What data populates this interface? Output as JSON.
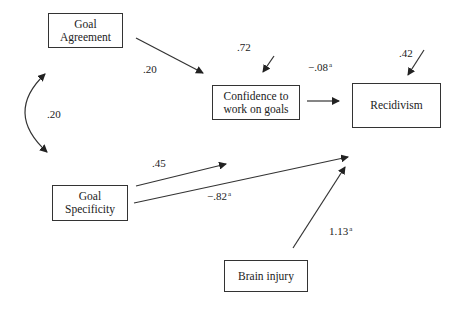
{
  "diagram": {
    "type": "path-model",
    "nodes": {
      "goal_agreement": {
        "line1": "Goal",
        "line2": "Agreement"
      },
      "confidence": {
        "line1": "Confidence to",
        "line2": "work on goals"
      },
      "recidivism": {
        "line1": "Recidivism"
      },
      "goal_specificity": {
        "line1": "Goal",
        "line2": "Specificity"
      },
      "brain_injury": {
        "line1": "Brain injury"
      }
    },
    "edges": [
      {
        "from": "Goal Agreement",
        "to": "Confidence to work on goals",
        "coef": ".20",
        "sup": ""
      },
      {
        "from": "Goal Specificity",
        "to": "Confidence to work on goals",
        "coef": ".45",
        "sup": ""
      },
      {
        "from": "Confidence to work on goals",
        "to": "Recidivism",
        "coef": "−.08",
        "sup": "a"
      },
      {
        "from": "Goal Specificity",
        "to": "Recidivism",
        "coef": "−.82",
        "sup": "a"
      },
      {
        "from": "Brain injury",
        "to": "Recidivism",
        "coef": "1.13",
        "sup": "a"
      }
    ],
    "correlation": {
      "between": [
        "Goal Agreement",
        "Goal Specificity"
      ],
      "coef": ".20"
    },
    "error_terms": {
      "confidence": ".72",
      "recidivism": ".42"
    },
    "colors": {
      "line": "#333333",
      "background": "#ffffff"
    }
  }
}
